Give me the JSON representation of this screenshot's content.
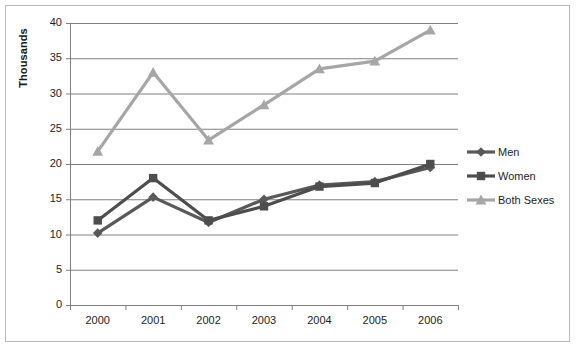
{
  "chart_data": {
    "type": "line",
    "title": "",
    "xlabel": "",
    "ylabel": "Thousands",
    "categories": [
      "2000",
      "2001",
      "2002",
      "2003",
      "2004",
      "2005",
      "2006"
    ],
    "ylim": [
      0,
      40
    ],
    "ytick_step": 5,
    "yticks": [
      "0",
      "5",
      "10",
      "15",
      "20",
      "25",
      "30",
      "35",
      "40"
    ],
    "grid": "horizontal",
    "legend_position": "right",
    "series": [
      {
        "name": "Men",
        "color": "#595959",
        "marker": "diamond",
        "values": [
          10.2,
          15.3,
          11.7,
          15.0,
          17.0,
          17.5,
          19.5
        ]
      },
      {
        "name": "Women",
        "color": "#4d4d4d",
        "marker": "square",
        "values": [
          12.0,
          18.0,
          12.0,
          14.0,
          16.8,
          17.3,
          20.0
        ]
      },
      {
        "name": "Both Sexes",
        "color": "#a6a6a6",
        "marker": "triangle",
        "values": [
          21.8,
          33.0,
          23.4,
          28.4,
          33.5,
          34.6,
          39.0
        ]
      }
    ]
  },
  "legend": {
    "items": [
      {
        "label": "Men"
      },
      {
        "label": "Women"
      },
      {
        "label": "Both Sexes"
      }
    ]
  },
  "colors": {
    "frame": "#b9b9b9",
    "gridline": "#808080",
    "axis": "#808080",
    "background": "#ffffff"
  }
}
